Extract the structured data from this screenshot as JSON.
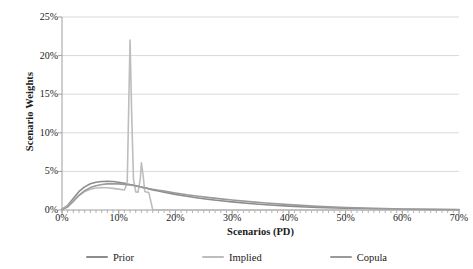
{
  "chart_data": {
    "type": "line",
    "title": "",
    "xlabel": "Scenarios (PD)",
    "ylabel": "Scenario Weights",
    "xlim": [
      0,
      70
    ],
    "ylim": [
      0,
      25
    ],
    "grid": "horizontal",
    "legend_position": "bottom",
    "x_tick_labels": [
      "0%",
      "10%",
      "20%",
      "30%",
      "40%",
      "50%",
      "60%",
      "70%"
    ],
    "x_tick_values": [
      0,
      10,
      20,
      30,
      40,
      50,
      60,
      70
    ],
    "x_minor_tick_interval": 1,
    "y_tick_labels": [
      "0%",
      "5%",
      "10%",
      "15%",
      "20%",
      "25%"
    ],
    "y_tick_values": [
      0,
      5,
      10,
      15,
      20,
      25
    ],
    "colors": {
      "prior": "#8c8c8c",
      "implied": "#bdbdbd",
      "copula": "#9a9a9a",
      "gridline": "#d9d9d9",
      "axis": "#9e9e9e",
      "text": "#1a1a1a",
      "background": "#ffffff"
    },
    "x": [
      0,
      1,
      2,
      3,
      4,
      5,
      6,
      7,
      8,
      9,
      10,
      11,
      11.5,
      12,
      12.3,
      12.6,
      13,
      13.4,
      13.8,
      14,
      14.3,
      14.6,
      15,
      15.3,
      16,
      17,
      18,
      20,
      22,
      24,
      26,
      28,
      30,
      33,
      36,
      40,
      45,
      50,
      55,
      60,
      65,
      70
    ],
    "series": [
      {
        "name": "Prior",
        "color": "#8c8c8c",
        "values": [
          0.1,
          0.6,
          1.5,
          2.4,
          3.0,
          3.4,
          3.6,
          3.7,
          3.72,
          3.7,
          3.6,
          3.45,
          3.38,
          3.3,
          3.26,
          3.22,
          3.15,
          3.08,
          3.0,
          2.96,
          2.9,
          2.85,
          2.78,
          2.72,
          2.6,
          2.45,
          2.3,
          2.02,
          1.78,
          1.56,
          1.37,
          1.2,
          1.05,
          0.85,
          0.68,
          0.5,
          0.33,
          0.22,
          0.14,
          0.09,
          0.05,
          0.03
        ]
      },
      {
        "name": "Implied",
        "color": "#bdbdbd",
        "values": [
          0.1,
          0.5,
          1.2,
          1.9,
          2.4,
          2.7,
          2.85,
          2.9,
          2.88,
          2.8,
          2.7,
          2.6,
          3.5,
          22.0,
          12.0,
          4.0,
          2.35,
          2.3,
          4.0,
          6.1,
          4.5,
          2.4,
          2.3,
          2.28,
          0.05,
          0.02,
          0.01,
          0.0,
          0.0,
          0.0,
          0.0,
          0.0,
          0.0,
          0.0,
          0.0,
          0.0,
          0.0,
          0.0,
          0.0,
          0.0,
          0.0,
          0.0
        ]
      },
      {
        "name": "Copula",
        "color": "#9a9a9a",
        "values": [
          0.05,
          0.4,
          1.1,
          1.9,
          2.5,
          2.9,
          3.15,
          3.3,
          3.38,
          3.4,
          3.38,
          3.32,
          3.28,
          3.24,
          3.21,
          3.18,
          3.12,
          3.06,
          3.0,
          2.97,
          2.93,
          2.89,
          2.83,
          2.78,
          2.68,
          2.56,
          2.44,
          2.2,
          1.98,
          1.78,
          1.6,
          1.44,
          1.29,
          1.08,
          0.9,
          0.69,
          0.47,
          0.32,
          0.21,
          0.13,
          0.08,
          0.05
        ]
      }
    ],
    "legend": [
      {
        "label": "Prior",
        "color": "#8c8c8c"
      },
      {
        "label": "Implied",
        "color": "#bdbdbd"
      },
      {
        "label": "Copula",
        "color": "#9a9a9a"
      }
    ]
  }
}
